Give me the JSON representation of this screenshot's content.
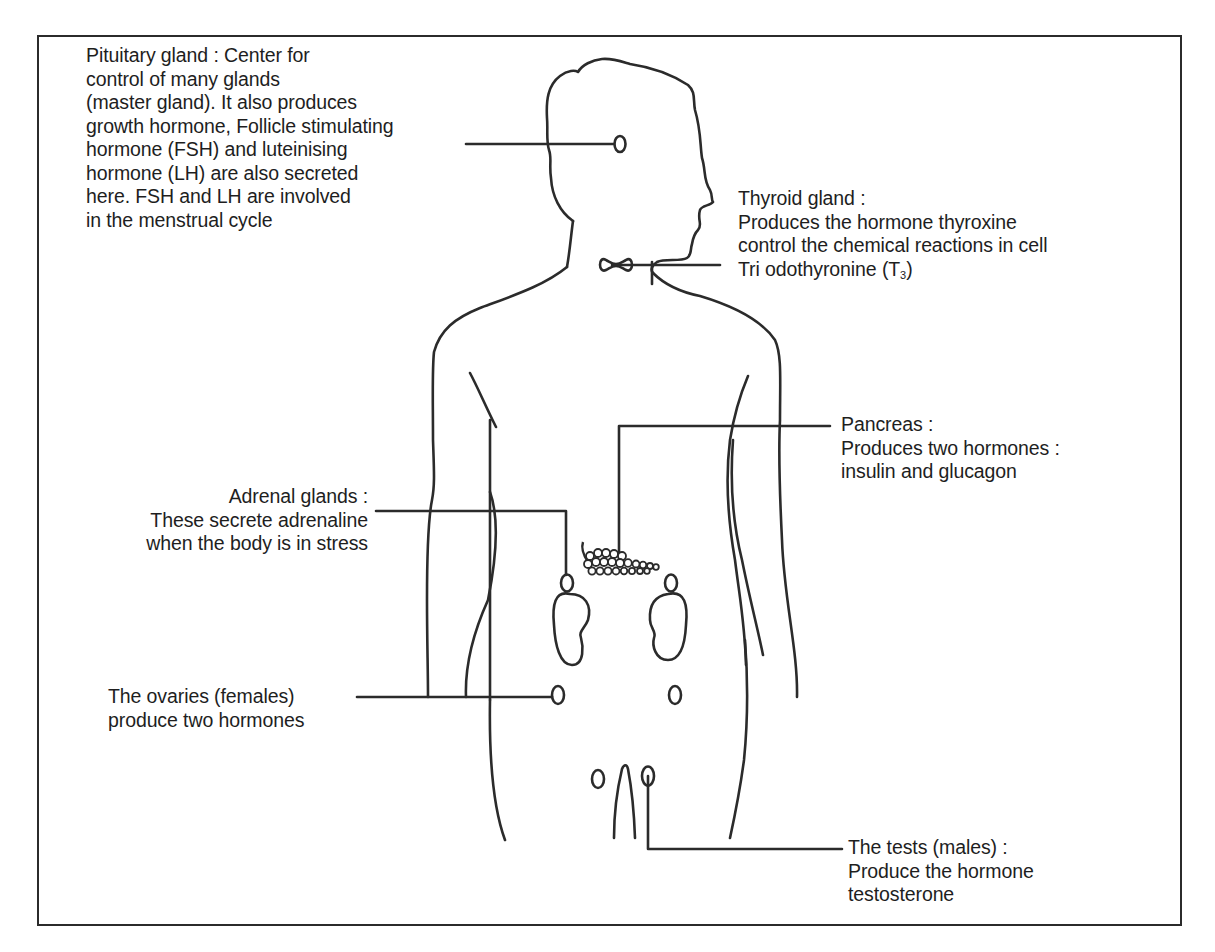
{
  "diagram": {
    "colors": {
      "line": "#2b2b2b",
      "text": "#1e1e1e",
      "background": "#ffffff"
    },
    "labels": {
      "pituitary": {
        "lines": [
          "Pituitary gland : Center for",
          "control of many glands",
          "(master gland). It also produces",
          "growth hormone, Follicle stimulating",
          "hormone (FSH) and luteinising",
          "hormone (LH) are also secreted",
          "here. FSH and LH are involved",
          "in the menstrual cycle"
        ]
      },
      "thyroid": {
        "lines": [
          "Thyroid gland :",
          "Produces the hormone thyroxine",
          "control the chemical reactions in cell"
        ],
        "t3_prefix": "Tri odothyronine (T",
        "t3_sub": "3",
        "t3_suffix": ")"
      },
      "pancreas": {
        "lines": [
          "Pancreas :",
          "Produces two hormones :",
          "insulin and glucagon"
        ]
      },
      "adrenal": {
        "lines": [
          "Adrenal glands :",
          "These secrete adrenaline",
          "when the body is in stress"
        ]
      },
      "ovaries": {
        "lines": [
          "The ovaries (females)",
          "produce two hormones"
        ]
      },
      "testes": {
        "lines": [
          "The tests (males) :",
          "Produce the hormone",
          "testosterone"
        ]
      }
    }
  }
}
